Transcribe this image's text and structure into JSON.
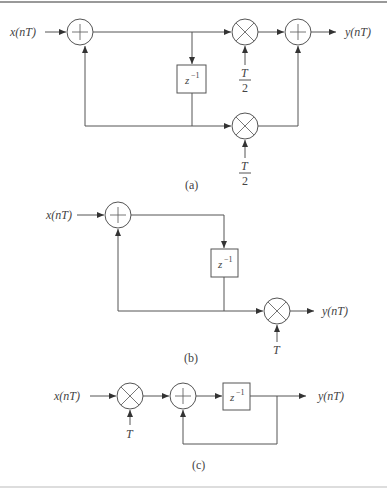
{
  "figure": {
    "diagram_a": {
      "input_label": "x(nT)",
      "output_label": "y(nT)",
      "delay_label": "z",
      "delay_exp": "−1",
      "gain_top_num": "T",
      "gain_top_den": "2",
      "gain_bottom_num": "T",
      "gain_bottom_den": "2",
      "caption": "(a)"
    },
    "diagram_b": {
      "input_label": "x(nT)",
      "output_label": "y(nT)",
      "delay_label": "z",
      "delay_exp": "−1",
      "gain": "T",
      "caption": "(b)"
    },
    "diagram_c": {
      "input_label": "x(nT)",
      "output_label": "y(nT)",
      "delay_label": "z",
      "delay_exp": "−1",
      "gain": "T",
      "caption": "(c)"
    }
  },
  "colors": {
    "line": "#555555",
    "text": "#444444",
    "border": "#999999"
  }
}
